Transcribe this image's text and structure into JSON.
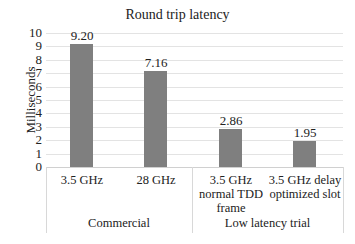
{
  "chart_data": {
    "type": "bar",
    "title": "Round trip latency",
    "xlabel": "",
    "ylabel": "Milliseconds",
    "ylim": [
      0,
      10
    ],
    "yticks": [
      "0",
      "1",
      "2",
      "3",
      "4",
      "5",
      "6",
      "7",
      "8",
      "9",
      "10"
    ],
    "grid": true,
    "legend": null,
    "categories": [
      "3.5 GHz",
      "28 GHz",
      "3.5 GHz normal TDD frame",
      "3.5 GHz delay optimized slot"
    ],
    "category_lines": [
      [
        "3.5 GHz"
      ],
      [
        "28 GHz"
      ],
      [
        "3.5 GHz",
        "normal TDD",
        "frame"
      ],
      [
        "3.5 GHz delay",
        "optimized slot"
      ]
    ],
    "groups": [
      {
        "label": "Commercial",
        "categories": [
          "3.5 GHz",
          "28 GHz"
        ]
      },
      {
        "label": "Low latency trial",
        "categories": [
          "3.5 GHz normal TDD frame",
          "3.5 GHz delay optimized slot"
        ]
      }
    ],
    "values": [
      9.2,
      7.16,
      2.86,
      1.95
    ],
    "value_labels": [
      "9.20",
      "7.16",
      "2.86",
      "1.95"
    ],
    "bar_color": "#7f7f7f"
  }
}
